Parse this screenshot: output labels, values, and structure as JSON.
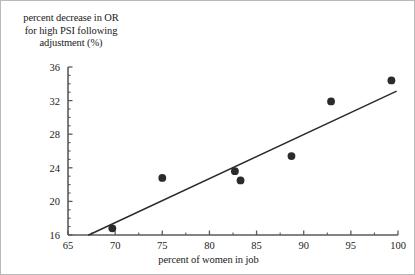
{
  "chart_data": {
    "type": "scatter",
    "title": "",
    "xlabel": "percent of women in job",
    "ylabel": "percent decrease in OR for high PSI following adjustment (%)",
    "ylabel_lines": [
      "percent decrease in OR",
      "for high PSI following",
      "adjustment (%)"
    ],
    "xlim": [
      65,
      100
    ],
    "ylim": [
      16,
      36
    ],
    "xticks": [
      65,
      70,
      75,
      80,
      85,
      90,
      95,
      100
    ],
    "yticks": [
      16,
      20,
      24,
      28,
      32,
      36
    ],
    "xtick_labels": [
      "65",
      "70",
      "75",
      "80",
      "85",
      "90",
      "95",
      "100"
    ],
    "ytick_labels": [
      "16",
      "20",
      "24",
      "28",
      "32",
      "36"
    ],
    "minor_ticks": true,
    "grid": false,
    "legend": false,
    "marker_color": "#2b2b2b",
    "line_color": "#2b2b2b",
    "axis_color": "#5a5a5a",
    "points": [
      {
        "x": 69.7,
        "y": 16.8
      },
      {
        "x": 75.0,
        "y": 22.8
      },
      {
        "x": 82.7,
        "y": 23.6
      },
      {
        "x": 83.3,
        "y": 22.5
      },
      {
        "x": 88.7,
        "y": 25.4
      },
      {
        "x": 92.9,
        "y": 31.9
      },
      {
        "x": 99.3,
        "y": 34.4
      }
    ],
    "fit_line": {
      "label": "regression line",
      "x_start": 67.2,
      "y_start": 16.0,
      "x_end": 99.8,
      "y_end": 33.1
    }
  }
}
